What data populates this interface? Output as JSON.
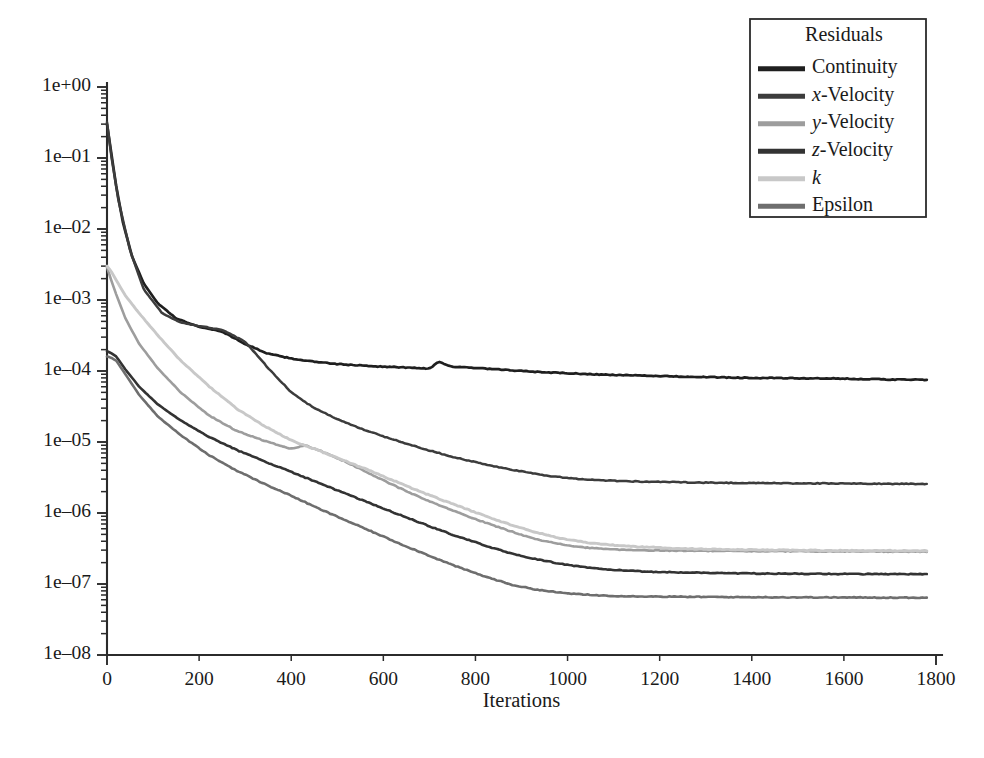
{
  "chart_data": {
    "type": "line",
    "title": "",
    "xlabel": "Iterations",
    "ylabel": "",
    "yscale": "log",
    "xlim": [
      0,
      1800
    ],
    "ylim": [
      1e-08,
      1.0
    ],
    "grid": false,
    "legend_position": "top-right",
    "legend_title": "Residuals",
    "x_ticks": [
      0,
      200,
      400,
      600,
      800,
      1000,
      1200,
      1400,
      1600,
      1800
    ],
    "x_tick_labels": [
      "0",
      "200",
      "400",
      "600",
      "800",
      "1000",
      "1200",
      "1400",
      "1600",
      "1800"
    ],
    "y_ticks": [
      1.0,
      0.1,
      0.01,
      0.001,
      0.0001,
      1e-05,
      1e-06,
      1e-07,
      1e-08
    ],
    "y_tick_labels": [
      "1e+00",
      "1e–01",
      "1e–02",
      "1e–03",
      "1e–04",
      "1e–05",
      "1e–06",
      "1e–07",
      "1e–08"
    ],
    "x_end_of_data": 1780,
    "series": [
      {
        "name": "Continuity",
        "label_html": "Continuity",
        "color": "#1f1f1f",
        "linewidth": 2.7,
        "x": [
          0,
          10,
          20,
          35,
          55,
          80,
          110,
          150,
          200,
          250,
          300,
          350,
          400,
          450,
          500,
          550,
          600,
          650,
          700,
          720,
          750,
          800,
          850,
          900,
          950,
          1000,
          1050,
          1100,
          1200,
          1300,
          1400,
          1500,
          1600,
          1700,
          1780
        ],
        "y": [
          0.3,
          0.11,
          0.04,
          0.012,
          0.004,
          0.0017,
          0.0009,
          0.00055,
          0.00042,
          0.00036,
          0.00024,
          0.000175,
          0.00015,
          0.000135,
          0.000125,
          0.00012,
          0.000115,
          0.000112,
          0.000108,
          0.000135,
          0.000115,
          0.00011,
          0.000105,
          0.0001,
          9.6e-05,
          9.3e-05,
          9e-05,
          8.8e-05,
          8.5e-05,
          8.2e-05,
          8e-05,
          7.9e-05,
          7.8e-05,
          7.6e-05,
          7.5e-05
        ]
      },
      {
        "name": "x-Velocity",
        "label_html": "<i>x</i>-Velocity",
        "color": "#3c3c3c",
        "linewidth": 2.5,
        "x": [
          0,
          10,
          25,
          50,
          80,
          120,
          160,
          200,
          250,
          300,
          350,
          400,
          450,
          500,
          550,
          600,
          650,
          700,
          750,
          800,
          850,
          900,
          950,
          1000,
          1050,
          1100,
          1150,
          1200,
          1300,
          1400,
          1500,
          1600,
          1700,
          1780
        ],
        "y": [
          0.32,
          0.1,
          0.025,
          0.005,
          0.0014,
          0.00065,
          0.00048,
          0.00043,
          0.00038,
          0.00026,
          0.00011,
          5e-05,
          3e-05,
          2.1e-05,
          1.55e-05,
          1.2e-05,
          9.5e-06,
          7.6e-06,
          6.2e-06,
          5.2e-06,
          4.4e-06,
          3.85e-06,
          3.4e-06,
          3.1e-06,
          2.95e-06,
          2.85e-06,
          2.78e-06,
          2.74e-06,
          2.68e-06,
          2.64e-06,
          2.62e-06,
          2.6e-06,
          2.58e-06,
          2.57e-06
        ]
      },
      {
        "name": "y-Velocity",
        "label_html": "<i>y</i>-Velocity",
        "color": "#9d9d9d",
        "linewidth": 2.6,
        "x": [
          0,
          8,
          20,
          40,
          70,
          110,
          160,
          220,
          280,
          340,
          400,
          430,
          470,
          520,
          570,
          620,
          680,
          740,
          800,
          860,
          920,
          960,
          1000,
          1040,
          1080,
          1150,
          1250,
          1350,
          1450,
          1550,
          1650,
          1780
        ],
        "y": [
          0.0029,
          0.002,
          0.0012,
          0.00055,
          0.00024,
          0.00011,
          5e-05,
          2.4e-05,
          1.45e-05,
          1.05e-05,
          8e-06,
          9e-06,
          7.2e-06,
          5.2e-06,
          3.6e-06,
          2.5e-06,
          1.65e-06,
          1.15e-06,
          8.2e-07,
          6e-07,
          4.5e-07,
          3.9e-07,
          3.5e-07,
          3.25e-07,
          3.1e-07,
          3e-07,
          2.95e-07,
          2.92e-07,
          2.9e-07,
          2.88e-07,
          2.87e-07,
          2.85e-07
        ]
      },
      {
        "name": "z-Velocity",
        "label_html": "<i>z</i>-Velocity",
        "color": "#333333",
        "linewidth": 2.6,
        "x": [
          0,
          8,
          20,
          40,
          70,
          110,
          160,
          220,
          280,
          340,
          400,
          460,
          520,
          580,
          640,
          700,
          760,
          820,
          880,
          930,
          980,
          1020,
          1060,
          1100,
          1160,
          1250,
          1350,
          1450,
          1550,
          1650,
          1780
        ],
        "y": [
          0.00019,
          0.00018,
          0.00016,
          0.000105,
          6e-05,
          3.4e-05,
          2e-05,
          1.2e-05,
          7.8e-06,
          5.4e-06,
          3.8e-06,
          2.65e-06,
          1.85e-06,
          1.3e-06,
          9.2e-07,
          6.5e-07,
          4.7e-07,
          3.5e-07,
          2.65e-07,
          2.25e-07,
          1.95e-07,
          1.78e-07,
          1.66e-07,
          1.58e-07,
          1.5e-07,
          1.45e-07,
          1.42e-07,
          1.4e-07,
          1.39e-07,
          1.38e-07,
          1.37e-07
        ]
      },
      {
        "name": "k",
        "label_html": "<i>k</i>",
        "color": "#c8c8c8",
        "linewidth": 2.9,
        "x": [
          0,
          8,
          20,
          40,
          70,
          110,
          160,
          220,
          280,
          340,
          400,
          450,
          500,
          560,
          620,
          680,
          740,
          800,
          860,
          920,
          960,
          1000,
          1040,
          1080,
          1150,
          1250,
          1350,
          1450,
          1550,
          1650,
          1780
        ],
        "y": [
          0.003,
          0.0026,
          0.0019,
          0.00115,
          0.00065,
          0.00032,
          0.00014,
          6.2e-05,
          3e-05,
          1.7e-05,
          1.05e-05,
          8e-06,
          6e-06,
          4.2e-06,
          2.9e-06,
          2e-06,
          1.42e-06,
          1.02e-06,
          7.4e-07,
          5.6e-07,
          4.8e-07,
          4.2e-07,
          3.85e-07,
          3.6e-07,
          3.35e-07,
          3.15e-07,
          3.05e-07,
          3e-07,
          2.97e-07,
          2.95e-07,
          2.93e-07
        ]
      },
      {
        "name": "Epsilon",
        "label_html": "Epsilon",
        "color": "#6e6e6e",
        "linewidth": 2.6,
        "x": [
          0,
          8,
          20,
          40,
          70,
          110,
          160,
          220,
          280,
          340,
          400,
          460,
          520,
          580,
          640,
          700,
          760,
          820,
          880,
          930,
          980,
          1020,
          1060,
          1100,
          1160,
          1250,
          1350,
          1450,
          1550,
          1650,
          1780
        ],
        "y": [
          0.00016,
          0.000155,
          0.00014,
          9e-05,
          4.6e-05,
          2.3e-05,
          1.25e-05,
          6.6e-06,
          4e-06,
          2.6e-06,
          1.75e-06,
          1.15e-06,
          7.8e-07,
          5.3e-07,
          3.6e-07,
          2.5e-07,
          1.75e-07,
          1.28e-07,
          9.7e-08,
          8.4e-08,
          7.6e-08,
          7.2e-08,
          6.95e-08,
          6.8e-08,
          6.7e-08,
          6.6e-08,
          6.55e-08,
          6.5e-08,
          6.48e-08,
          6.45e-08,
          6.4e-08
        ]
      }
    ]
  },
  "plot_geometry": {
    "x0_px": 107,
    "x1_px": 936,
    "y_top_px": 87,
    "y_bottom_px": 655,
    "legend": {
      "x": 750,
      "y": 19,
      "width": 176,
      "height": 198
    }
  }
}
